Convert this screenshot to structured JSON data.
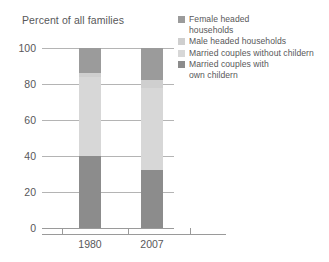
{
  "chart_data": {
    "type": "bar",
    "subtype": "stacked-column-100",
    "title": "Percent of all families",
    "xlabel": "",
    "ylabel": "Percent of all families",
    "categories": [
      "1980",
      "2007"
    ],
    "ylim": [
      0,
      100
    ],
    "yticks": [
      0,
      20,
      40,
      60,
      80,
      100
    ],
    "ytick_labels": [
      "0",
      "20",
      "40",
      "60",
      "80",
      "100"
    ],
    "grid": true,
    "grid_axis": "y",
    "legend_position": "top-right",
    "series": [
      {
        "name": "Female headed households",
        "color": "#9b9b9b",
        "values": [
          14,
          18
        ]
      },
      {
        "name": "Male headed households",
        "color": "#cfcfcf",
        "values": [
          2,
          4
        ]
      },
      {
        "name": "Married couples without childern",
        "color": "#d7d7d7",
        "values": [
          44,
          46
        ]
      },
      {
        "name": "Married couples with own childern",
        "color": "#8c8c8c",
        "values": [
          40,
          32
        ]
      }
    ],
    "stack_order_bottom_to_top": [
      "Married couples with own childern",
      "Married couples without childern",
      "Male headed households",
      "Female headed households"
    ]
  },
  "legend": {
    "items": [
      {
        "label": "Female headed\nhouseholds",
        "color": "#9b9b9b"
      },
      {
        "label": "Male headed households",
        "color": "#cfcfcf"
      },
      {
        "label": "Married couples without childern",
        "color": "#d7d7d7"
      },
      {
        "label": "Married couples with\nown childern",
        "color": "#8c8c8c"
      }
    ]
  },
  "axes": {
    "y_tick_labels": [
      "100",
      "80",
      "60",
      "40",
      "20",
      "0"
    ],
    "x_tick_labels": [
      "1980",
      "2007"
    ]
  },
  "colors": {
    "female_headed": "#9b9b9b",
    "male_headed": "#cfcfcf",
    "married_without_children": "#d7d7d7",
    "married_with_children": "#8c8c8c",
    "gridline": "#b4b4b4",
    "axis": "#9a9a9a",
    "text": "#58585a",
    "background": "#ffffff"
  }
}
